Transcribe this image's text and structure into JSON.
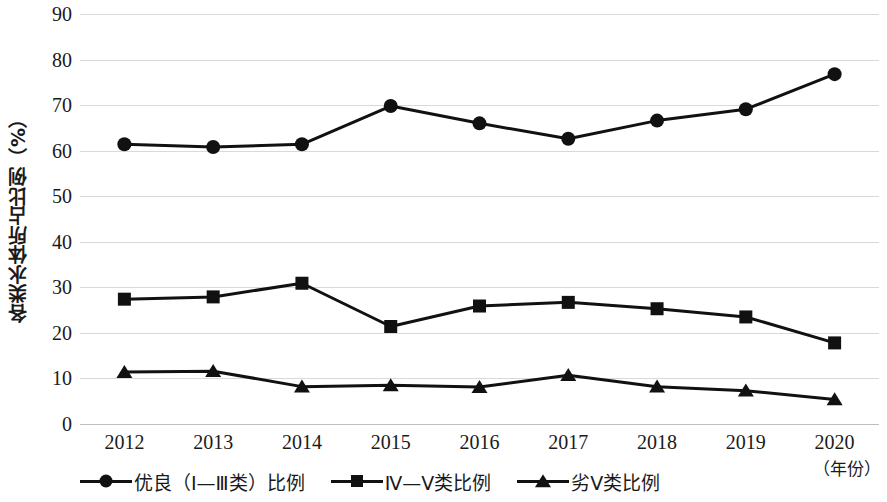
{
  "chart_data": {
    "type": "line",
    "title": "",
    "xlabel": "（年份）",
    "ylabel": "各类水体所占比例（%）",
    "categories": [
      "2012",
      "2013",
      "2014",
      "2015",
      "2016",
      "2017",
      "2018",
      "2019",
      "2020"
    ],
    "ylim": [
      0,
      90
    ],
    "ytick_step": 10,
    "yticks": [
      "90",
      "80",
      "70",
      "60",
      "50",
      "40",
      "30",
      "20",
      "10",
      "0"
    ],
    "grid": "horizontal",
    "legend_position": "bottom",
    "series": [
      {
        "name": "优良（Ⅰ—Ⅲ类）比例",
        "marker": "circle",
        "color": "#111111",
        "values": [
          61.4,
          60.8,
          61.4,
          69.8,
          66.0,
          62.6,
          66.6,
          69.1,
          76.8
        ]
      },
      {
        "name": "Ⅳ—Ⅴ类比例",
        "marker": "square",
        "color": "#111111",
        "values": [
          27.4,
          27.9,
          30.9,
          21.4,
          25.9,
          26.7,
          25.3,
          23.5,
          17.8
        ]
      },
      {
        "name": "劣Ⅴ类比例",
        "marker": "triangle",
        "color": "#111111",
        "values": [
          11.4,
          11.6,
          8.2,
          8.5,
          8.1,
          10.7,
          8.2,
          7.3,
          5.4
        ]
      }
    ]
  },
  "axes": {
    "y_title": "各类水体所占比例（%）",
    "x_title": "（年份）"
  },
  "legend": {
    "items": [
      {
        "label": "优良（Ⅰ—Ⅲ类）比例",
        "marker": "circle-marker"
      },
      {
        "label": "Ⅳ—Ⅴ类比例",
        "marker": "square-marker"
      },
      {
        "label": "劣Ⅴ类比例",
        "marker": "triangle-marker"
      }
    ]
  }
}
